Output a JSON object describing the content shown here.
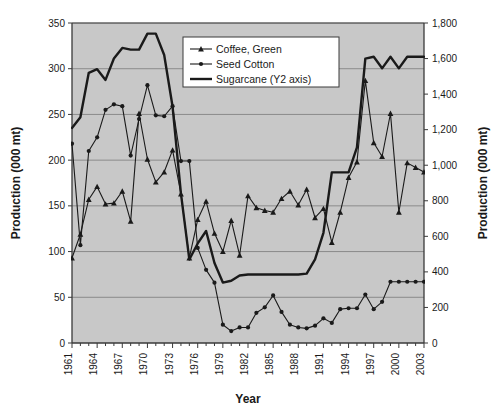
{
  "chart_data": {
    "type": "line",
    "title": "",
    "xlabel": "Year",
    "ylabel": "Production (000 mt)",
    "y2label": "Production (000 mt)",
    "ylim": [
      0,
      350
    ],
    "y2lim": [
      0,
      1800
    ],
    "yticks": [
      "0",
      "50",
      "100",
      "150",
      "200",
      "250",
      "300",
      "350"
    ],
    "ytick_values": [
      0,
      50,
      100,
      150,
      200,
      250,
      300,
      350
    ],
    "y2ticks": [
      "0",
      "200",
      "400",
      "600",
      "800",
      "1,000",
      "1,200",
      "1,400",
      "1,600",
      "1,800"
    ],
    "y2tick_values": [
      0,
      200,
      400,
      600,
      800,
      1000,
      1200,
      1400,
      1600,
      1800
    ],
    "grid": true,
    "grid_axis": "y",
    "legend_position": "top-center",
    "plot_background": "#c8c8c8",
    "figure_background": "#ffffff",
    "line_color": "#1a1a1a",
    "x": [
      1961,
      1962,
      1963,
      1964,
      1965,
      1966,
      1967,
      1968,
      1969,
      1970,
      1971,
      1972,
      1973,
      1974,
      1975,
      1976,
      1977,
      1978,
      1979,
      1980,
      1981,
      1982,
      1983,
      1984,
      1985,
      1986,
      1987,
      1988,
      1989,
      1990,
      1991,
      1992,
      1993,
      1994,
      1995,
      1996,
      1997,
      1998,
      1999,
      2000,
      2001,
      2002,
      2003
    ],
    "xticks": [
      "1961",
      "1964",
      "1967",
      "1970",
      "1973",
      "1976",
      "1979",
      "1982",
      "1985",
      "1988",
      "1991",
      "1994",
      "1997",
      "2000",
      "2003"
    ],
    "xtick_values": [
      1961,
      1964,
      1967,
      1970,
      1973,
      1976,
      1979,
      1982,
      1985,
      1988,
      1991,
      1994,
      1997,
      2000,
      2003
    ],
    "series": [
      {
        "name": "Coffee, Green",
        "axis": "y1",
        "marker": "triangle",
        "values": [
          93,
          119,
          157,
          171,
          152,
          153,
          166,
          133,
          251,
          201,
          176,
          187,
          211,
          163,
          93,
          135,
          155,
          120,
          100,
          134,
          96,
          161,
          148,
          145,
          143,
          158,
          166,
          151,
          168,
          137,
          147,
          110,
          143,
          181,
          198,
          287,
          219,
          204,
          251,
          143,
          197,
          192,
          187
        ]
      },
      {
        "name": "Seed Cotton",
        "axis": "y1",
        "marker": "circle",
        "values": [
          218,
          107,
          210,
          225,
          255,
          261,
          259,
          205,
          245,
          282,
          249,
          248,
          259,
          199,
          199,
          104,
          80,
          66,
          20,
          13,
          17,
          17,
          33,
          39,
          52,
          34,
          20,
          17,
          16,
          19,
          27,
          22,
          37,
          38,
          38,
          53,
          37,
          45,
          67,
          67,
          67,
          67,
          67
        ]
      },
      {
        "name": "Sugarcane (Y2 axis)",
        "axis": "y2",
        "marker": "none",
        "values": [
          1210,
          1270,
          1520,
          1540,
          1480,
          1600,
          1660,
          1650,
          1650,
          1740,
          1740,
          1620,
          1330,
          840,
          470,
          560,
          630,
          450,
          340,
          350,
          380,
          385,
          385,
          385,
          385,
          385,
          385,
          385,
          390,
          470,
          620,
          960,
          960,
          960,
          1100,
          1600,
          1610,
          1545,
          1610,
          1545,
          1610,
          1610,
          1610
        ]
      }
    ],
    "legend": [
      {
        "label": "Coffee, Green",
        "marker": "triangle"
      },
      {
        "label": "Seed Cotton",
        "marker": "circle"
      },
      {
        "label": "Sugarcane (Y2 axis)",
        "marker": "line"
      }
    ]
  }
}
